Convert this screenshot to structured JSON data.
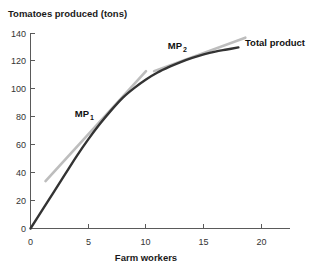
{
  "chart_data": {
    "type": "line",
    "title": "",
    "ylabel": "Tomatoes produced (tons)",
    "xlabel": "Farm workers",
    "xlim": [
      0,
      21
    ],
    "ylim": [
      0,
      145
    ],
    "xticks": [
      "0",
      "5",
      "10",
      "15",
      "20"
    ],
    "xtick_values": [
      0,
      5,
      10,
      15,
      20
    ],
    "yticks": [
      "0",
      "20",
      "40",
      "60",
      "80",
      "100",
      "120",
      "140"
    ],
    "ytick_values": [
      0,
      20,
      40,
      60,
      80,
      100,
      120,
      140
    ],
    "grid": false,
    "legend_position": "inline-annotations",
    "series": [
      {
        "name": "Total product",
        "color": "#333333",
        "x": [
          0,
          1,
          2,
          3,
          4,
          5,
          6,
          7,
          8,
          9,
          10,
          11,
          12,
          13,
          14,
          15,
          16,
          17,
          18
        ],
        "values": [
          0,
          13,
          26,
          39,
          52,
          64,
          75,
          85,
          94,
          101,
          107,
          112,
          116,
          119.5,
          122.5,
          125,
          127,
          128.5,
          130
        ]
      },
      {
        "name": "MP1 tangent",
        "color": "#bdbdbd",
        "x": [
          1.3,
          10.0
        ],
        "values": [
          34,
          113
        ]
      },
      {
        "name": "MP2 tangent",
        "color": "#bdbdbd",
        "x": [
          10.7,
          18.6
        ],
        "values": [
          113,
          137
        ]
      }
    ],
    "annotations": [
      {
        "text": "MP",
        "subscript": "1",
        "x": 5.2,
        "y": 86
      },
      {
        "text": "MP",
        "subscript": "2",
        "x": 11.4,
        "y": 127
      },
      {
        "text": "Total product",
        "subscript": "",
        "x": 18.9,
        "y": 133
      }
    ]
  }
}
